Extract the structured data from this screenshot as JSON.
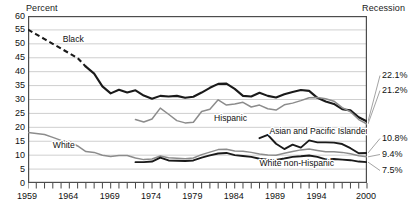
{
  "header": {
    "y_axis_title": "Percent",
    "recession_label": "Recession"
  },
  "chart_data": {
    "type": "line",
    "title": "",
    "subtitle": "",
    "xlabel": "",
    "ylabel": "Percent",
    "xlim": [
      1959,
      2000
    ],
    "ylim": [
      0,
      60
    ],
    "grid": true,
    "legend_position": "inline-annotations",
    "ytick_labels": [
      "60",
      "55",
      "50",
      "45",
      "40",
      "35",
      "30",
      "25",
      "20",
      "15",
      "10",
      "5",
      "0"
    ],
    "ytick_values": [
      60,
      55,
      50,
      45,
      40,
      35,
      30,
      25,
      20,
      15,
      10,
      5,
      0
    ],
    "xtick_labels": [
      "1959",
      "1964",
      "1969",
      "1974",
      "1979",
      "1984",
      "1989",
      "1994",
      "2000"
    ],
    "xtick_values": [
      1959,
      1964,
      1969,
      1974,
      1979,
      1984,
      1989,
      1994,
      2000
    ],
    "x_minor_ticks_every": 1,
    "end_value_labels": [
      {
        "text": "22.1%",
        "value": 22.1,
        "series": "Black"
      },
      {
        "text": "21.2%",
        "value": 21.2,
        "series": "Hispanic"
      },
      {
        "text": "10.8%",
        "value": 10.8,
        "series": "Asian and Pacific Islander"
      },
      {
        "text": "9.4%",
        "value": 9.4,
        "series": "White"
      },
      {
        "text": "7.5%",
        "value": 7.5,
        "series": "White non-Hispanic"
      }
    ],
    "annotations": [
      {
        "text": "Black",
        "x": 1963.2,
        "y": 50.6
      },
      {
        "text": "Hispanic",
        "x": 1981.5,
        "y": 22.4
      },
      {
        "text": "Asian and Pacific Islander",
        "x": 1988.2,
        "y": 17.6
      },
      {
        "text": "White",
        "x": 1962.0,
        "y": 12.6
      },
      {
        "text": "White non-Hispanic",
        "x": 1987.0,
        "y": 6.2
      }
    ],
    "series": [
      {
        "name": "Black",
        "color": "#1a1a1a",
        "width": 2.1,
        "dashed_segment": {
          "from": 1959,
          "to": 1966
        },
        "x": [
          1959,
          1960,
          1961,
          1962,
          1963,
          1964,
          1965,
          1966,
          1967,
          1968,
          1969,
          1970,
          1971,
          1972,
          1973,
          1974,
          1975,
          1976,
          1977,
          1978,
          1979,
          1980,
          1981,
          1982,
          1983,
          1984,
          1985,
          1986,
          1987,
          1988,
          1989,
          1990,
          1991,
          1992,
          1993,
          1994,
          1995,
          1996,
          1997,
          1998,
          1999,
          2000
        ],
        "values": [
          55.1,
          53.4,
          51.7,
          50.0,
          48.3,
          46.6,
          44.9,
          41.8,
          39.3,
          34.7,
          32.2,
          33.5,
          32.5,
          33.3,
          31.4,
          30.3,
          31.3,
          31.1,
          31.3,
          30.6,
          31.0,
          32.5,
          34.2,
          35.6,
          35.7,
          33.8,
          31.3,
          31.1,
          32.4,
          31.3,
          30.7,
          31.9,
          32.7,
          33.4,
          33.1,
          30.6,
          29.3,
          28.4,
          26.5,
          26.1,
          23.6,
          22.1
        ]
      },
      {
        "name": "Hispanic",
        "color": "#8c8c8c",
        "width": 1.5,
        "x": [
          1972,
          1973,
          1974,
          1975,
          1976,
          1977,
          1978,
          1979,
          1980,
          1981,
          1982,
          1983,
          1984,
          1985,
          1986,
          1987,
          1988,
          1989,
          1990,
          1991,
          1992,
          1993,
          1994,
          1995,
          1996,
          1997,
          1998,
          1999,
          2000
        ],
        "values": [
          22.8,
          21.9,
          23.0,
          26.9,
          24.7,
          22.4,
          21.6,
          21.8,
          25.7,
          26.5,
          29.9,
          28.0,
          28.4,
          29.0,
          27.3,
          28.0,
          26.7,
          26.2,
          28.1,
          28.7,
          29.6,
          30.6,
          30.7,
          30.3,
          29.4,
          27.1,
          25.6,
          22.8,
          21.2
        ]
      },
      {
        "name": "Asian and Pacific Islander",
        "color": "#1a1a1a",
        "width": 1.9,
        "x": [
          1987,
          1988,
          1989,
          1990,
          1991,
          1992,
          1993,
          1994,
          1995,
          1996,
          1997,
          1998,
          1999,
          2000
        ],
        "values": [
          16.1,
          17.3,
          14.1,
          12.2,
          13.8,
          12.7,
          15.3,
          14.6,
          14.6,
          14.5,
          14.0,
          12.5,
          10.7,
          10.8
        ]
      },
      {
        "name": "White",
        "color": "#8c8c8c",
        "width": 1.5,
        "x": [
          1959,
          1960,
          1961,
          1962,
          1963,
          1964,
          1965,
          1966,
          1967,
          1968,
          1969,
          1970,
          1971,
          1972,
          1973,
          1974,
          1975,
          1976,
          1977,
          1978,
          1979,
          1980,
          1981,
          1982,
          1983,
          1984,
          1985,
          1986,
          1987,
          1988,
          1989,
          1990,
          1991,
          1992,
          1993,
          1994,
          1995,
          1996,
          1997,
          1998,
          1999,
          2000
        ],
        "values": [
          18.1,
          17.8,
          17.4,
          16.4,
          15.3,
          14.9,
          13.3,
          11.3,
          11.0,
          10.0,
          9.5,
          9.9,
          9.9,
          9.0,
          8.4,
          8.6,
          9.7,
          9.1,
          8.9,
          8.7,
          9.0,
          10.2,
          11.1,
          12.0,
          12.1,
          11.5,
          11.4,
          11.0,
          10.4,
          10.1,
          10.0,
          10.7,
          11.3,
          11.9,
          12.2,
          11.7,
          11.2,
          11.2,
          11.0,
          10.5,
          9.8,
          9.4
        ]
      },
      {
        "name": "White non-Hispanic",
        "color": "#1a1a1a",
        "width": 1.9,
        "x": [
          1972,
          1973,
          1974,
          1975,
          1976,
          1977,
          1978,
          1979,
          1980,
          1981,
          1982,
          1983,
          1984,
          1985,
          1986,
          1987,
          1988,
          1989,
          1990,
          1991,
          1992,
          1993,
          1994,
          1995,
          1996,
          1997,
          1998,
          1999,
          2000
        ],
        "values": [
          7.5,
          7.5,
          7.7,
          9.1,
          8.1,
          8.0,
          7.9,
          8.1,
          9.1,
          9.9,
          10.6,
          10.8,
          10.0,
          9.7,
          9.4,
          8.7,
          8.4,
          8.3,
          8.8,
          9.4,
          9.6,
          9.9,
          9.4,
          8.5,
          8.6,
          8.4,
          8.2,
          7.7,
          7.5
        ]
      }
    ]
  }
}
